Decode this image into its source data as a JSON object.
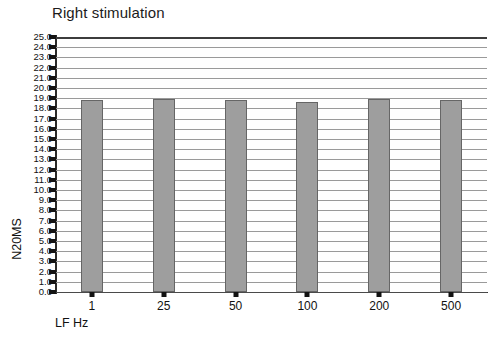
{
  "chart_data": {
    "type": "bar",
    "title": "Right stimulation",
    "xlabel": "LF Hz",
    "ylabel": "N20MS",
    "categories": [
      "1",
      "25",
      "50",
      "100",
      "200",
      "500"
    ],
    "values": [
      18.8,
      18.9,
      18.8,
      18.6,
      18.9,
      18.8
    ],
    "ylim": [
      0.0,
      25.0
    ],
    "ytick_step": 1.0,
    "yticks": [
      "25.0",
      "24.0",
      "23.0",
      "22.0",
      "21.0",
      "20.0",
      "19.0",
      "18.0",
      "17.0",
      "16.0",
      "15.0",
      "14.0",
      "13.0",
      "12.0",
      "11.0",
      "10.0",
      "9.0",
      "8.0",
      "7.0",
      "6.0",
      "5.0",
      "4.0",
      "3.0",
      "2.0",
      "1.0",
      "0.0"
    ],
    "grid": true,
    "grid_orientation": "horizontal",
    "legend": "none",
    "bar_color": "#9e9e9e",
    "bar_edge_color": "#666666",
    "grid_color": "#9a9a9a",
    "axis_color": "#2a2a2a",
    "background": "#ffffff"
  }
}
